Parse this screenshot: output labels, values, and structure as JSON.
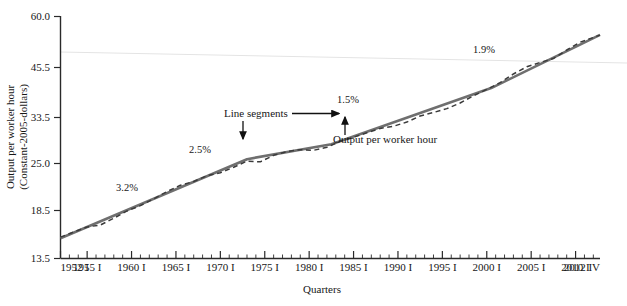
{
  "chart_data": {
    "type": "line",
    "title": "",
    "xlabel": "Quarters",
    "ylabel_line1": "Output per worker hour",
    "ylabel_line2": "(Constant-2005-dollars)",
    "y_ticks": [
      "13.5",
      "18.5",
      "25.0",
      "33.5",
      "45.5",
      "60.0"
    ],
    "y_tick_values": [
      13.5,
      18.5,
      25.0,
      33.5,
      45.5,
      60.0
    ],
    "ylim": [
      13.5,
      60.0
    ],
    "y_scale": "log",
    "x_ticks": [
      "1952 I",
      "1955 I",
      "1960 I",
      "1965 I",
      "1970 I",
      "1975 I",
      "1980 I",
      "1985 I",
      "1990 I",
      "1995 I",
      "2000 I",
      "2005 I",
      "2010 I",
      "2012 IV"
    ],
    "x_tick_years": [
      1952,
      1955,
      1960,
      1965,
      1970,
      1975,
      1980,
      1985,
      1990,
      1995,
      2000,
      2005,
      2010,
      2012.75
    ],
    "xlim": [
      1952,
      2012.75
    ],
    "grid": false,
    "legend_position": "none",
    "series": [
      {
        "name": "Output per worker hour",
        "style": "dashed",
        "color": "#3a3a3a",
        "x": [
          1952,
          1953.5,
          1955,
          1956.5,
          1958,
          1959.5,
          1961,
          1962.5,
          1964,
          1965.5,
          1967,
          1968.5,
          1970,
          1971.5,
          1973,
          1974.5,
          1976,
          1977.5,
          1979,
          1980.5,
          1982,
          1983.5,
          1985,
          1986.5,
          1988,
          1989.5,
          1991,
          1992.5,
          1994,
          1995.5,
          1997,
          1998.5,
          2000,
          2001.5,
          2003,
          2004.5,
          2006,
          2007.5,
          2009,
          2010.5,
          2012.75
        ],
        "y": [
          15.4,
          15.9,
          16.4,
          16.6,
          17.3,
          18.1,
          18.7,
          19.5,
          20.4,
          21.2,
          21.7,
          22.5,
          22.9,
          23.7,
          24.6,
          24.5,
          25.5,
          26.1,
          26.4,
          26.3,
          26.8,
          27.8,
          28.5,
          29.3,
          30.1,
          30.5,
          31.3,
          32.5,
          33.2,
          34.0,
          35.2,
          36.8,
          38.3,
          39.9,
          42.1,
          44.0,
          45.2,
          46.3,
          48.8,
          51.2,
          53.5
        ]
      },
      {
        "name": "Line segments",
        "style": "solid",
        "color": "#6b6b6b",
        "breakpoints_x": [
          1952,
          1973,
          1982.5,
          2000.5,
          2012.75
        ],
        "breakpoints_y": [
          15.3,
          24.9,
          27.3,
          38.6,
          53.6
        ]
      }
    ],
    "annotations": [
      {
        "id": "growth-1",
        "label": "3.2%",
        "x": 116,
        "y": 191
      },
      {
        "id": "growth-2",
        "label": "2.5%",
        "x": 189,
        "y": 153
      },
      {
        "id": "growth-3",
        "label": "1.5%",
        "x": 349,
        "y": 103
      },
      {
        "id": "growth-4",
        "label": "1.9%",
        "x": 485,
        "y": 53
      },
      {
        "id": "callout-line-segments",
        "label": "Line segments",
        "x": 224,
        "y": 117
      },
      {
        "id": "callout-output",
        "label": "Output per worker hour",
        "x": 333,
        "y": 143
      }
    ]
  },
  "colors": {
    "axis": "#2a2a2a",
    "trend_line": "#6f6f6f",
    "data_line": "#3b3b3b",
    "faint_line": "#e2e2e2",
    "annotation": "#111111"
  }
}
